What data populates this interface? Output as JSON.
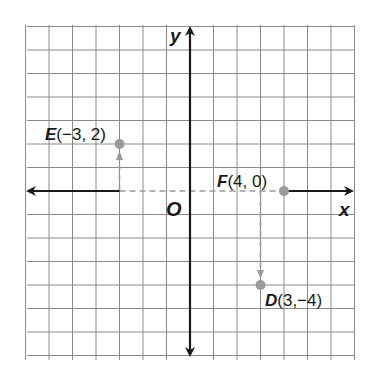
{
  "diagram": {
    "type": "coordinate-plane",
    "grid": {
      "x_range": [
        -7,
        7
      ],
      "y_range": [
        -7,
        7
      ],
      "unit_px": 23.5,
      "origin_px": [
        190,
        191
      ],
      "line_color": "#8a8a8a"
    },
    "axes": {
      "x_label": "x",
      "y_label": "y",
      "origin_label": "O",
      "color": "#1a1a1a"
    },
    "points": [
      {
        "name": "E",
        "label": "E(-3, 2)",
        "x": -3,
        "y": 2,
        "letter": "E",
        "coords": "(−3, 2)"
      },
      {
        "name": "F",
        "label": "F(4, 0)",
        "x": 4,
        "y": 0,
        "letter": "F",
        "coords": "(4, 0)"
      },
      {
        "name": "D",
        "label": "D(3,-4)",
        "x": 3,
        "y": -4,
        "letter": "D",
        "coords": "(3,−4)"
      }
    ],
    "guides": [
      {
        "from": "E",
        "path": "vertical from (-3,0) up to E",
        "style": "dashed-arrow"
      },
      {
        "from": "origin",
        "path": "horizontal along x-axis from (-3,0) to F",
        "style": "dashed"
      },
      {
        "from": "F",
        "path": "vertical from (3,0) down to D",
        "style": "dashed-arrow"
      }
    ],
    "point_color": "#9a9a9a",
    "guide_color": "#9a9a9a"
  }
}
